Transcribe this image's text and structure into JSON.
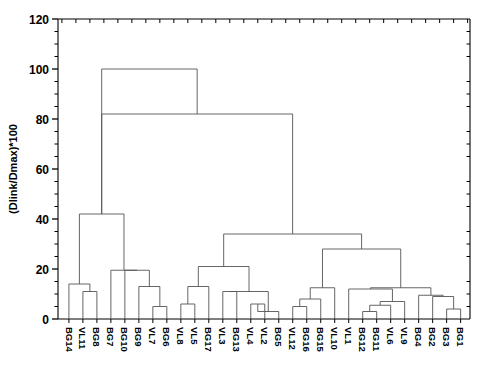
{
  "chart_data": {
    "type": "dendrogram",
    "title": "",
    "xlabel": "",
    "ylabel": "(Dlink/Dmax)*100",
    "ylim": [
      0,
      120
    ],
    "yticks": [
      0,
      20,
      40,
      60,
      80,
      100,
      120
    ],
    "ytick_labels": [
      "0",
      "20",
      "40",
      "60",
      "80",
      "100",
      "120"
    ],
    "grid": false,
    "legend": null,
    "minor_ticks": true,
    "leaf_order": [
      "BG14",
      "VL11",
      "BG8",
      "BG7",
      "BG10",
      "BG9",
      "VL7",
      "BG6",
      "VL8",
      "VL5",
      "BG17",
      "VL3",
      "BG13",
      "VL4",
      "VL2",
      "BG5",
      "VL12",
      "BG16",
      "BG15",
      "VL10",
      "VL1",
      "BG12",
      "BG11",
      "VL6",
      "VL9",
      "BG4",
      "BG2",
      "BG3",
      "BG1"
    ],
    "leaf_count": 29,
    "linkage_unit": "(Dlink/Dmax)*100",
    "merges": [
      {
        "id": "m1",
        "left": "VL11",
        "right": "BG8",
        "height": 11.0
      },
      {
        "id": "m2",
        "left": "BG14",
        "right": "m1",
        "height": 14.0
      },
      {
        "id": "m3",
        "left": "VL7",
        "right": "BG6",
        "height": 5.0
      },
      {
        "id": "m4",
        "left": "BG9",
        "right": "m3",
        "height": 13.0
      },
      {
        "id": "m5",
        "left": "BG10",
        "right": "m4",
        "height": 19.5
      },
      {
        "id": "m6",
        "left": "BG7",
        "right": "m5",
        "height": 19.5
      },
      {
        "id": "m7",
        "left": "m2",
        "right": "m6",
        "height": 42.0
      },
      {
        "id": "m8",
        "left": "VL8",
        "right": "VL5",
        "height": 6.0
      },
      {
        "id": "m9",
        "left": "BG17",
        "right": "m8",
        "height": 13.0
      },
      {
        "id": "m10",
        "left": "VL3",
        "right": "BG13",
        "height": 11.0
      },
      {
        "id": "m11",
        "left": "VL4",
        "right": "VL2",
        "height": 6.0
      },
      {
        "id": "m12",
        "left": "m11",
        "right": "BG5",
        "height": 3.0
      },
      {
        "id": "m13",
        "left": "m10",
        "right": "m12",
        "height": 11.0
      },
      {
        "id": "m14",
        "left": "m9",
        "right": "m13",
        "height": 21.0
      },
      {
        "id": "m15",
        "left": "VL12",
        "right": "BG16",
        "height": 5.0
      },
      {
        "id": "m16",
        "left": "m15",
        "right": "BG15",
        "height": 8.0
      },
      {
        "id": "m17",
        "left": "VL10",
        "right": "m16",
        "height": 12.5
      },
      {
        "id": "m18",
        "left": "BG12",
        "right": "BG11",
        "height": 3.0
      },
      {
        "id": "m19",
        "left": "m18",
        "right": "VL6",
        "height": 5.5
      },
      {
        "id": "m20",
        "left": "m19",
        "right": "VL9",
        "height": 7.0
      },
      {
        "id": "m21",
        "left": "VL1",
        "right": "m20",
        "height": 12.0
      },
      {
        "id": "m22",
        "left": "BG3",
        "right": "BG1",
        "height": 4.0
      },
      {
        "id": "m23",
        "left": "BG2",
        "right": "m22",
        "height": 9.0
      },
      {
        "id": "m24",
        "left": "BG4",
        "right": "m23",
        "height": 9.5
      },
      {
        "id": "m25",
        "left": "m21",
        "right": "m24",
        "height": 12.5
      },
      {
        "id": "m26",
        "left": "m17",
        "right": "m25",
        "height": 28.0
      },
      {
        "id": "m27",
        "left": "m14",
        "right": "m26",
        "height": 34.0
      },
      {
        "id": "m28",
        "left": "m7",
        "right": "m27",
        "height": 82.0
      },
      {
        "id": "m29",
        "left": "m28",
        "right": "ROOTPAIR",
        "height": 100.0
      }
    ],
    "root": {
      "left": "m7",
      "right": "m27",
      "height_inner": 82.0,
      "height_outer": 100.0
    },
    "colors": {
      "line": "#555555",
      "axis": "#000000",
      "background": "#ffffff",
      "text": "#000000"
    }
  }
}
